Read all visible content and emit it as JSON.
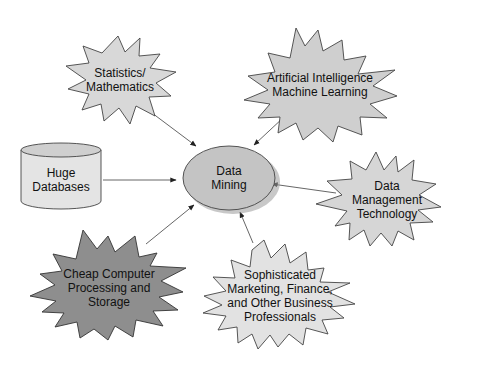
{
  "diagram": {
    "center": {
      "label_lines": [
        "Data",
        "Mining"
      ]
    },
    "nodes": [
      {
        "id": "statistics",
        "label_lines": [
          "Statistics/",
          "Mathematics"
        ],
        "shape": "starburst",
        "fill": "#d8d8d8"
      },
      {
        "id": "ai",
        "label_lines": [
          "Artificial Intelligence",
          "Machine Learning"
        ],
        "shape": "starburst",
        "fill": "#cfcfcf"
      },
      {
        "id": "databases",
        "label_lines": [
          "Huge",
          "Databases"
        ],
        "shape": "cylinder",
        "fill": "#e4e4e4"
      },
      {
        "id": "dmt",
        "label_lines": [
          "Data",
          "Management",
          "Technology"
        ],
        "shape": "starburst",
        "fill": "#d6d6d6"
      },
      {
        "id": "cheap",
        "label_lines": [
          "Cheap Computer",
          "Processing and",
          "Storage"
        ],
        "shape": "starburst",
        "fill": "#8e8e8e"
      },
      {
        "id": "business",
        "label_lines": [
          "Sophisticated",
          "Marketing, Finance,",
          "and Other Business",
          "Professionals"
        ],
        "shape": "starburst",
        "fill": "#e2e2e2"
      }
    ],
    "colors": {
      "center_fill": "#c4c4c4",
      "stroke": "#444444",
      "shadow": "#9a9a9a"
    }
  }
}
